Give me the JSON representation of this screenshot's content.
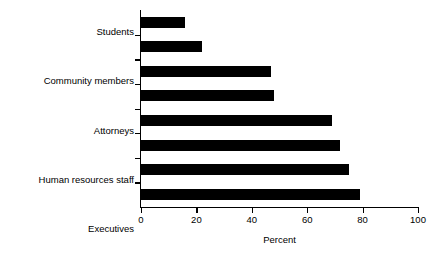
{
  "chart_data": {
    "type": "bar",
    "orientation": "horizontal",
    "title": "",
    "subtitle": "",
    "xlabel": "Percent",
    "ylabel": "",
    "xlim": [
      0,
      100
    ],
    "xticks": [
      0,
      20,
      40,
      60,
      80,
      100
    ],
    "xtick_labels": [
      "0",
      "20",
      "40",
      "60",
      "80",
      "100"
    ],
    "grid": false,
    "legend": false,
    "legend_position": "none",
    "bar_color": "#000000",
    "axis_color": "#000000",
    "background_color": "#ffffff",
    "categories": [
      "Students",
      "Community members",
      "Attorneys",
      "Human resources staff",
      "Executives",
      "Other industrial hygienists",
      "Other program managers",
      "Workers"
    ],
    "values": [
      16,
      22,
      47,
      48,
      69,
      72,
      75,
      79
    ],
    "annotations": []
  }
}
